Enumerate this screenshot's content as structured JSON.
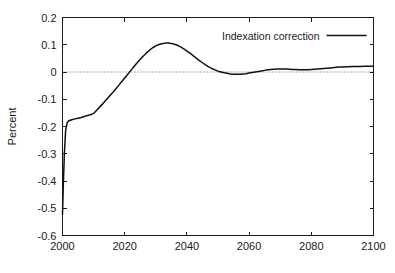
{
  "chart_data": {
    "type": "line",
    "title": "",
    "xlabel": "",
    "ylabel": "Percent",
    "xlim": [
      2000,
      2100
    ],
    "ylim": [
      -0.6,
      0.2
    ],
    "xticks": [
      2000,
      2020,
      2040,
      2060,
      2080,
      2100
    ],
    "xtick_labels": [
      "2000",
      "2020",
      "2040",
      "2060",
      "2080",
      "2100"
    ],
    "yticks": [
      0.2,
      0.1,
      0,
      -0.1,
      -0.2,
      -0.3,
      -0.4,
      -0.5,
      -0.6
    ],
    "ytick_labels": [
      "0.2",
      "0.1",
      "0",
      "-0.1",
      "-0.2",
      "-0.3",
      "-0.4",
      "-0.5",
      "-0.6"
    ],
    "grid": false,
    "zero_reference_line": 0,
    "legend_position": "top-right",
    "legend": [
      "Indexation correction"
    ],
    "series": [
      {
        "name": "Indexation correction",
        "color": "#111111",
        "x": [
          2000,
          2000.3,
          2000.6,
          2001,
          2001.5,
          2002,
          2003,
          2004,
          2005,
          2006,
          2007,
          2008,
          2009,
          2010,
          2011,
          2012,
          2013,
          2014,
          2015,
          2016,
          2017,
          2018,
          2019,
          2020,
          2021,
          2022,
          2023,
          2024,
          2025,
          2026,
          2027,
          2028,
          2029,
          2030,
          2031,
          2032,
          2033,
          2034,
          2035,
          2036,
          2037,
          2038,
          2039,
          2040,
          2041,
          2042,
          2043,
          2044,
          2045,
          2046,
          2047,
          2048,
          2049,
          2050,
          2051,
          2052,
          2053,
          2054,
          2055,
          2056,
          2057,
          2058,
          2059,
          2060,
          2061,
          2062,
          2063,
          2064,
          2065,
          2066,
          2067,
          2068,
          2069,
          2070,
          2071,
          2072,
          2073,
          2074,
          2075,
          2076,
          2077,
          2078,
          2079,
          2080,
          2081,
          2082,
          2083,
          2084,
          2085,
          2086,
          2087,
          2088,
          2089,
          2090,
          2091,
          2092,
          2093,
          2094,
          2095,
          2096,
          2097,
          2098,
          2099,
          2100
        ],
        "y": [
          -0.522,
          -0.4,
          -0.3,
          -0.215,
          -0.186,
          -0.179,
          -0.175,
          -0.172,
          -0.17,
          -0.167,
          -0.163,
          -0.16,
          -0.157,
          -0.152,
          -0.14,
          -0.128,
          -0.116,
          -0.103,
          -0.09,
          -0.077,
          -0.064,
          -0.05,
          -0.036,
          -0.022,
          -0.008,
          0.006,
          0.02,
          0.034,
          0.047,
          0.059,
          0.07,
          0.08,
          0.089,
          0.096,
          0.101,
          0.104,
          0.106,
          0.106,
          0.105,
          0.102,
          0.098,
          0.092,
          0.085,
          0.077,
          0.069,
          0.06,
          0.051,
          0.042,
          0.034,
          0.026,
          0.019,
          0.013,
          0.008,
          0.003,
          0.0,
          -0.003,
          -0.005,
          -0.007,
          -0.008,
          -0.008,
          -0.008,
          -0.007,
          -0.006,
          -0.004,
          -0.002,
          0.0,
          0.002,
          0.004,
          0.006,
          0.008,
          0.009,
          0.01,
          0.011,
          0.011,
          0.011,
          0.011,
          0.01,
          0.009,
          0.009,
          0.008,
          0.008,
          0.008,
          0.008,
          0.009,
          0.01,
          0.011,
          0.012,
          0.013,
          0.014,
          0.015,
          0.016,
          0.017,
          0.018,
          0.018,
          0.019,
          0.019,
          0.02,
          0.02,
          0.02,
          0.02,
          0.021,
          0.021,
          0.021,
          0.021
        ]
      }
    ]
  }
}
